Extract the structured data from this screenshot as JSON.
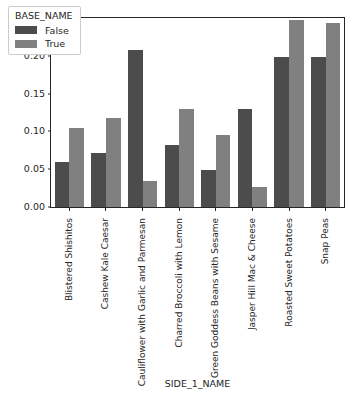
{
  "chart_data": {
    "type": "bar",
    "title": "",
    "xlabel": "SIDE_1_NAME",
    "ylabel": "",
    "categories": [
      "Blistered Shishitos",
      "Cashew Kale Caesar",
      "Cauliflower with Garlic and Parmesan",
      "Charred Broccoli with Lemon",
      "Green Goddess Beans with Sesame",
      "Jasper Hill Mac & Cheese",
      "Roasted Sweet Potatoes",
      "Snap Peas"
    ],
    "series": [
      {
        "name": "False",
        "color": "#4c4c4c",
        "values": [
          0.06,
          0.072,
          0.208,
          0.082,
          0.049,
          0.13,
          0.199,
          0.198
        ]
      },
      {
        "name": "True",
        "color": "#808080",
        "values": [
          0.105,
          0.118,
          0.034,
          0.129,
          0.095,
          0.027,
          0.247,
          0.243
        ]
      }
    ],
    "legend": {
      "title": "BASE_NAME",
      "position": "upper-left"
    },
    "ylim": [
      0.0,
      0.25
    ],
    "yticks": [
      0.0,
      0.05,
      0.1,
      0.15,
      0.2,
      0.25
    ],
    "ytick_labels": [
      "0.00",
      "0.05",
      "0.10",
      "0.15",
      "0.20",
      "0.25"
    ],
    "grid": false
  }
}
